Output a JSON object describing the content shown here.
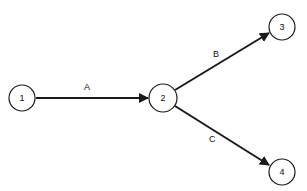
{
  "diagram": {
    "type": "network-graph",
    "nodes": [
      {
        "id": "1",
        "label": "1",
        "x": 22,
        "y": 98
      },
      {
        "id": "2",
        "label": "2",
        "x": 163,
        "y": 98
      },
      {
        "id": "3",
        "label": "3",
        "x": 282,
        "y": 27
      },
      {
        "id": "4",
        "label": "4",
        "x": 282,
        "y": 172
      }
    ],
    "edges": [
      {
        "from": "1",
        "to": "2",
        "label": "A"
      },
      {
        "from": "2",
        "to": "3",
        "label": "B"
      },
      {
        "from": "2",
        "to": "4",
        "label": "C"
      }
    ],
    "colors": {
      "stroke": "#1a1a1a",
      "background": "#ffffff"
    }
  }
}
